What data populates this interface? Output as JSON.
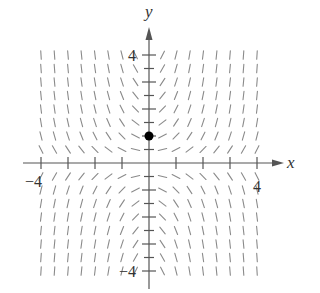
{
  "figure": {
    "type": "slope-field",
    "equation": "dy/dx = xy",
    "x_axis_label": "x",
    "y_axis_label": "y",
    "x_range": [
      -4,
      4
    ],
    "y_range": [
      -4,
      4
    ],
    "x_tick_labels": [
      {
        "value": -4,
        "text": "−4"
      },
      {
        "value": 4,
        "text": "4"
      }
    ],
    "y_tick_labels": [
      {
        "value": 4,
        "text": "4"
      },
      {
        "value": -4,
        "text": "−4"
      }
    ],
    "x_ticks": [
      -4,
      -3,
      -2,
      -1,
      1,
      2,
      3,
      4
    ],
    "y_ticks": [
      -4,
      -3.5,
      -3,
      -2.5,
      -2,
      -1.5,
      -1,
      -0.5,
      0.5,
      1,
      1.5,
      2,
      2.5,
      3,
      3.5,
      4
    ],
    "field_step": 0.5,
    "initial_point": {
      "x": 0,
      "y": 1
    },
    "colors": {
      "axis": "#555555",
      "segment": "#8a8a8a",
      "text": "#333333",
      "point": "#000000"
    }
  }
}
